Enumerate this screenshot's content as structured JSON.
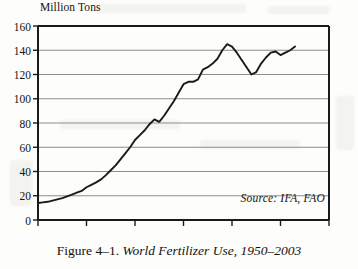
{
  "figure": {
    "caption_number": "Figure 4–1.",
    "caption_title": "World Fertilizer Use, 1950–2003",
    "source_note": "Source: IFA, FAO"
  },
  "chart_data": {
    "type": "line",
    "title": "World Fertilizer Use, 1950–2003",
    "xlabel": "",
    "ylabel": "Million Tons",
    "ylim": [
      0,
      160
    ],
    "xlim": [
      1950,
      2010
    ],
    "yticks": [
      0,
      20,
      40,
      60,
      80,
      100,
      120,
      140,
      160
    ],
    "xticks": [
      1950,
      1960,
      1970,
      1980,
      1990,
      2000,
      2010
    ],
    "ytick_labels": [
      "0",
      "20",
      "40",
      "60",
      "80",
      "100",
      "120",
      "140",
      "160"
    ],
    "xtick_labels": [
      "1950",
      "1960",
      "1970",
      "1980",
      "1990",
      "2000",
      "2010"
    ],
    "grid": "horizontal",
    "legend": "none",
    "line_color": "#1a1a1a",
    "grid_color": "#8d8d8d",
    "axis_color": "#1a1a1a",
    "series": [
      {
        "name": "World fertilizer use",
        "x": [
          1950,
          1951,
          1952,
          1953,
          1954,
          1955,
          1956,
          1957,
          1958,
          1959,
          1960,
          1961,
          1962,
          1963,
          1964,
          1965,
          1966,
          1967,
          1968,
          1969,
          1970,
          1971,
          1972,
          1973,
          1974,
          1975,
          1976,
          1977,
          1978,
          1979,
          1980,
          1981,
          1982,
          1983,
          1984,
          1985,
          1986,
          1987,
          1988,
          1989,
          1990,
          1991,
          1992,
          1993,
          1994,
          1995,
          1996,
          1997,
          1998,
          1999,
          2000,
          2001,
          2002,
          2003
        ],
        "values": [
          14,
          14.5,
          15,
          16,
          17,
          18,
          19.5,
          21,
          22.5,
          24,
          27,
          29,
          31,
          33.5,
          37,
          41,
          45,
          50,
          55,
          60,
          66,
          70,
          74,
          79,
          83,
          81,
          86,
          92,
          98,
          105,
          112,
          114,
          114,
          116,
          124,
          126,
          129,
          133,
          140,
          145,
          143,
          138,
          132,
          126,
          120,
          122,
          129,
          134,
          138,
          139,
          136,
          138,
          140,
          143
        ]
      }
    ]
  }
}
